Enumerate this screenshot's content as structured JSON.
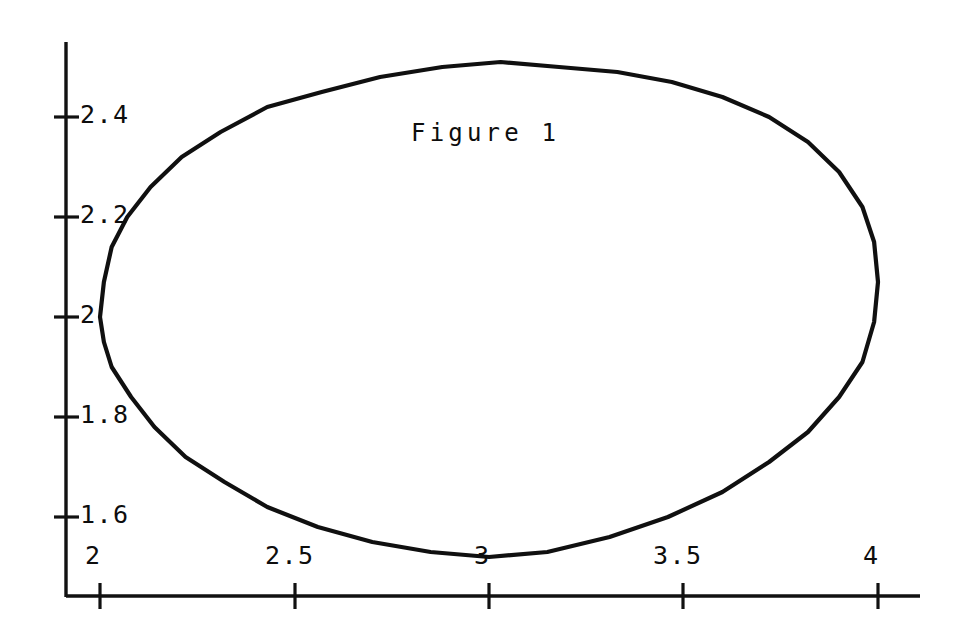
{
  "figure": {
    "caption": "Figure 1",
    "background_color": "#ffffff",
    "ink_color": "#101010"
  },
  "chart_data": {
    "type": "line",
    "title": "Figure 1",
    "xlabel": "",
    "ylabel": "",
    "grid": false,
    "legend": false,
    "axis_style": "two-spine (left and bottom), outward tick marks, no frame",
    "xlim": [
      1.93,
      4.22
    ],
    "ylim": [
      1.44,
      2.58
    ],
    "xticks": [
      2,
      2.5,
      3,
      3.5,
      4
    ],
    "xtick_labels": [
      "2",
      "2.5",
      "3",
      "3.5",
      "4"
    ],
    "yticks": [
      1.6,
      1.8,
      2,
      2.2,
      2.4
    ],
    "ytick_labels": [
      "1.6",
      "1.8",
      "2",
      "2.2",
      "2.4"
    ],
    "series": [
      {
        "name": "closed-contour",
        "closed": true,
        "description": "Single closed oval / limit-cycle contour drawn as a hand-plotted curve",
        "x": [
          2.0,
          2.01,
          2.03,
          2.07,
          2.13,
          2.21,
          2.31,
          2.43,
          2.57,
          2.72,
          2.88,
          3.03,
          3.18,
          3.33,
          3.47,
          3.6,
          3.72,
          3.82,
          3.9,
          3.96,
          3.99,
          4.0,
          3.99,
          3.96,
          3.9,
          3.82,
          3.72,
          3.6,
          3.46,
          3.31,
          3.15,
          3.0,
          2.85,
          2.7,
          2.56,
          2.43,
          2.32,
          2.22,
          2.14,
          2.08,
          2.03,
          2.01,
          2.0
        ],
        "y": [
          2.0,
          2.07,
          2.14,
          2.2,
          2.26,
          2.32,
          2.37,
          2.42,
          2.45,
          2.48,
          2.5,
          2.51,
          2.5,
          2.49,
          2.47,
          2.44,
          2.4,
          2.35,
          2.29,
          2.22,
          2.15,
          2.07,
          1.99,
          1.91,
          1.84,
          1.77,
          1.71,
          1.65,
          1.6,
          1.56,
          1.53,
          1.52,
          1.53,
          1.55,
          1.58,
          1.62,
          1.67,
          1.72,
          1.78,
          1.84,
          1.9,
          1.95,
          2.0
        ],
        "extrema": {
          "leftmost_x": 2.0,
          "rightmost_x": 4.0,
          "top_y": 2.51,
          "bottom_y": 1.52
        }
      }
    ]
  },
  "axes": {
    "y_axis_labels": [
      {
        "value": "2.4"
      },
      {
        "value": "2.2"
      },
      {
        "value": "2"
      },
      {
        "value": "1.8"
      },
      {
        "value": "1.6"
      }
    ],
    "x_axis_labels": [
      {
        "value": "2"
      },
      {
        "value": "2.5"
      },
      {
        "value": "3"
      },
      {
        "value": "3.5"
      },
      {
        "value": "4"
      }
    ]
  }
}
